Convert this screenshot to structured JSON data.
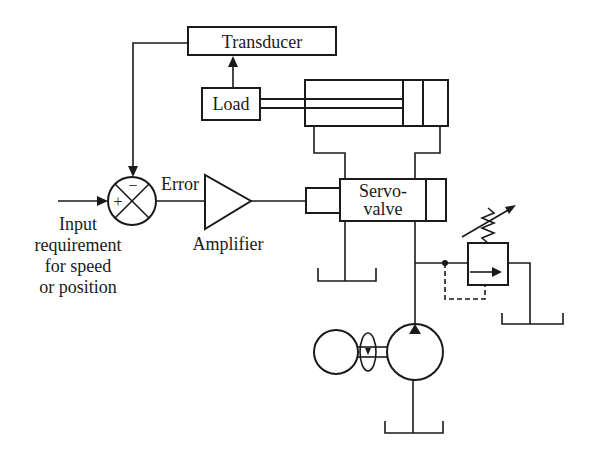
{
  "diagram": {
    "blocks": {
      "transducer": "Transducer",
      "load": "Load",
      "servovalve_line1": "Servo-",
      "servovalve_line2": "valve",
      "amplifier": "Amplifier"
    },
    "summing_junction": {
      "plus": "+",
      "minus": "−"
    },
    "signals": {
      "error": "Error"
    },
    "input_label": {
      "line1": "Input",
      "line2": "requirement",
      "line3": "for speed",
      "line4": "or position"
    },
    "components": [
      "transducer",
      "load",
      "hydraulic-cylinder",
      "servo-valve",
      "summing-junction",
      "amplifier",
      "pressure-relief-valve",
      "hydraulic-pump",
      "electric-motor",
      "tank-servo-return",
      "tank-relief-return",
      "tank-pump-suction"
    ],
    "colors": {
      "line": "#1a1a1a",
      "background": "#ffffff"
    }
  }
}
